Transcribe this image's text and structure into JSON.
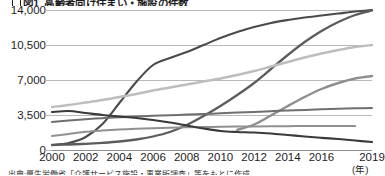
{
  "figure": {
    "title_number": "図1",
    "title": "高齢者向け住まい・施設の件数",
    "source_note": "出典:厚生労働省「介護サービス施設・事業所調査」等をもとに作成",
    "x_unit": "(年)"
  },
  "chart_data": {
    "type": "line",
    "xlabel": "(年)",
    "ylabel": "",
    "xlim": [
      2000,
      2019
    ],
    "ylim": [
      0,
      14000
    ],
    "yticks": [
      0,
      3500,
      7000,
      10500,
      14000
    ],
    "ytick_labels": [
      "0",
      "3,500",
      "7,000",
      "10,500",
      "14,000"
    ],
    "xticks": [
      2000,
      2002,
      2004,
      2006,
      2008,
      2010,
      2012,
      2014,
      2016,
      2019
    ],
    "xtick_labels": [
      "2000",
      "2002",
      "2004",
      "2006",
      "2008",
      "2010",
      "2012",
      "2014",
      "2016",
      "2019"
    ],
    "grid": "horizontal",
    "legend": "none",
    "x": [
      2000,
      2001,
      2002,
      2003,
      2004,
      2005,
      2006,
      2007,
      2008,
      2009,
      2010,
      2011,
      2012,
      2013,
      2014,
      2015,
      2016,
      2017,
      2018,
      2019
    ],
    "series": [
      {
        "name": "series-1-grouphome",
        "color": "#4a4a4a",
        "width": 2.1,
        "values": [
          500,
          700,
          1300,
          2600,
          4700,
          6800,
          8500,
          9200,
          9800,
          10500,
          11200,
          11800,
          12300,
          12700,
          13000,
          13250,
          13450,
          13650,
          13850,
          14000
        ]
      },
      {
        "name": "series-2-paid-nursing-home",
        "color": "#5c5c5c",
        "width": 2.3,
        "values": [
          500,
          550,
          620,
          720,
          850,
          1050,
          1350,
          1800,
          2500,
          3400,
          4400,
          5500,
          6700,
          8100,
          9500,
          10800,
          11900,
          12800,
          13500,
          13950
        ]
      },
      {
        "name": "series-3-light-gray",
        "color": "#bdbdbd",
        "width": 2.4,
        "values": [
          4300,
          4500,
          4750,
          5000,
          5300,
          5600,
          5950,
          6250,
          6550,
          6850,
          7150,
          7500,
          7900,
          8350,
          8800,
          9250,
          9650,
          10000,
          10300,
          10500
        ]
      },
      {
        "name": "series-4-mid-gray-late",
        "color": "#8e8e8e",
        "width": 2.4,
        "values": [
          null,
          null,
          null,
          null,
          null,
          null,
          null,
          null,
          null,
          null,
          null,
          2000,
          2550,
          3450,
          4400,
          5300,
          6100,
          6700,
          7150,
          7400
        ]
      },
      {
        "name": "series-5-flat-upper",
        "color": "#6f6f6f",
        "width": 2.0,
        "values": [
          2800,
          2950,
          3080,
          3180,
          3270,
          3350,
          3420,
          3480,
          3540,
          3600,
          3670,
          3740,
          3810,
          3880,
          3950,
          4010,
          4070,
          4120,
          4170,
          4200
        ]
      },
      {
        "name": "series-6-flat-lower",
        "color": "#909090",
        "width": 2.0,
        "values": [
          1400,
          1600,
          1820,
          1950,
          2050,
          2120,
          2180,
          2230,
          2270,
          2300,
          2320,
          2340,
          2355,
          2370,
          2385,
          2395,
          2400,
          2405,
          2410,
          null
        ]
      },
      {
        "name": "series-7-declining",
        "color": "#3a3a3a",
        "width": 2.2,
        "values": [
          3800,
          3900,
          3700,
          3500,
          3350,
          3200,
          3000,
          2750,
          2450,
          2150,
          1900,
          1800,
          1750,
          1650,
          1500,
          1350,
          1220,
          1100,
          950,
          800
        ]
      }
    ]
  }
}
